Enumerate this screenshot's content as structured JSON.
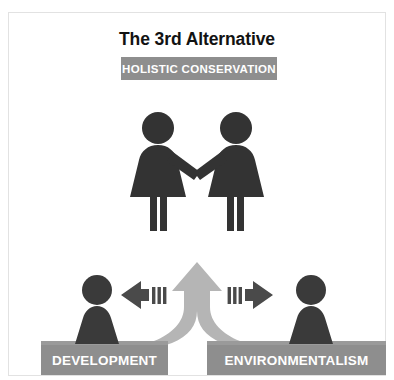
{
  "slide": {
    "title": "The 3rd Alternative",
    "banner_label": "HOLISTIC CONSERVATION",
    "background_color": "#ffffff",
    "frame_color": "#e2e2e2"
  },
  "bottom_boxes": [
    {
      "label": "DEVELOPMENT",
      "color": "#8e8e8e"
    },
    {
      "label": "ENVIRONMENTALISM",
      "color": "#8e8e8e"
    }
  ],
  "figures": {
    "top_pair": {
      "description": "two people shaking hands",
      "color": "#333333",
      "count": 2
    },
    "bottom_pair": {
      "description": "two single standing people",
      "color": "#3a3a3a",
      "count": 2
    }
  },
  "arrows": {
    "merge_up": {
      "name": "merging-upward-arrow",
      "color": "#b5b5b5",
      "direction": "up"
    },
    "left": {
      "name": "left-arrow",
      "color": "#4a4a4a",
      "direction": "left",
      "tail_stripes": 3
    },
    "right": {
      "name": "right-arrow",
      "color": "#4a4a4a",
      "direction": "right",
      "tail_stripes": 3
    }
  },
  "ground": {
    "color": "#9a9a9a"
  }
}
